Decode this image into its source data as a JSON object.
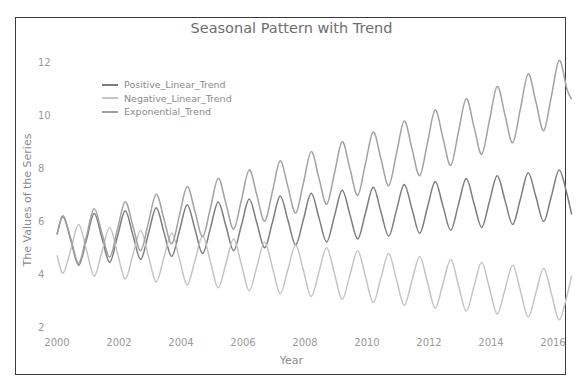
{
  "chart_data": {
    "type": "line",
    "title": "Seasonal Pattern with Trend",
    "xlabel": "Year",
    "ylabel": "The Values of the Series",
    "xlim": [
      2000,
      2016.7
    ],
    "ylim": [
      2,
      12.2
    ],
    "x_ticks": [
      "2000",
      "2002",
      "2004",
      "2006",
      "2008",
      "2010",
      "2012",
      "2014",
      "2016"
    ],
    "y_ticks": [
      "2",
      "4",
      "6",
      "8",
      "10",
      "12"
    ],
    "grid": false,
    "legend_position": "upper left",
    "x": [
      0,
      0.2,
      0.45,
      0.7,
      0.95,
      1.2,
      1.45,
      1.7,
      1.95,
      2.2,
      2.45,
      2.7,
      2.95,
      3.2,
      3.45,
      3.7,
      3.95,
      4.2,
      4.45,
      4.7,
      4.95,
      5.2,
      5.45,
      5.7,
      5.95,
      6.2,
      6.45,
      6.7,
      6.95,
      7.2,
      7.45,
      7.7,
      7.95,
      8.2,
      8.45,
      8.7,
      8.95,
      9.2,
      9.45,
      9.7,
      9.95,
      10.2,
      10.45,
      10.7,
      10.95,
      11.2,
      11.45,
      11.7,
      11.95,
      12.2,
      12.45,
      12.7,
      12.95,
      13.2,
      13.45,
      13.7,
      13.95,
      14.2,
      14.45,
      14.7,
      14.95,
      15.2,
      15.45,
      15.7,
      15.95,
      16.2,
      16.45,
      16.6
    ],
    "x_offset_year": 2000,
    "series": [
      {
        "name": "Positive_Linear_Trend",
        "color": "#7d7d7d",
        "values": [
          5.49,
          6.17,
          5.25,
          4.33,
          5.3,
          6.28,
          5.36,
          4.44,
          5.41,
          6.39,
          5.47,
          4.55,
          5.52,
          6.5,
          5.58,
          4.66,
          5.63,
          6.61,
          5.69,
          4.77,
          5.74,
          6.72,
          5.8,
          4.88,
          5.85,
          6.83,
          5.91,
          4.99,
          5.96,
          6.94,
          6.02,
          5.1,
          6.07,
          7.05,
          6.13,
          5.21,
          6.18,
          7.16,
          6.24,
          5.32,
          6.29,
          7.27,
          6.35,
          5.43,
          6.4,
          7.38,
          6.46,
          5.54,
          6.51,
          7.49,
          6.57,
          5.65,
          6.62,
          7.6,
          6.68,
          5.76,
          6.73,
          7.71,
          6.79,
          5.87,
          6.84,
          7.82,
          6.9,
          5.98,
          6.95,
          7.93,
          7.01,
          6.25
        ]
      },
      {
        "name": "Negative_Linear_Trend",
        "color": "#c4c4c4",
        "values": [
          4.71,
          4.03,
          4.95,
          5.87,
          4.9,
          3.92,
          4.84,
          5.76,
          4.79,
          3.81,
          4.73,
          5.65,
          4.68,
          3.7,
          4.62,
          5.54,
          4.57,
          3.59,
          4.51,
          5.43,
          4.46,
          3.48,
          4.4,
          5.32,
          4.35,
          3.37,
          4.29,
          5.21,
          4.24,
          3.26,
          4.18,
          5.1,
          4.13,
          3.15,
          4.07,
          4.99,
          4.02,
          3.04,
          3.96,
          4.88,
          3.91,
          2.93,
          3.85,
          4.77,
          3.8,
          2.82,
          3.74,
          4.66,
          3.69,
          2.71,
          3.63,
          4.55,
          3.58,
          2.6,
          3.52,
          4.44,
          3.47,
          2.49,
          3.41,
          4.33,
          3.36,
          2.38,
          3.3,
          4.22,
          3.25,
          2.27,
          3.19,
          3.94
        ]
      },
      {
        "name": "Exponential_Trend",
        "color": "#a2a2a2",
        "values": [
          5.49,
          6.2,
          5.31,
          4.41,
          5.43,
          6.46,
          5.55,
          4.64,
          5.68,
          6.73,
          5.81,
          4.88,
          5.94,
          7.01,
          6.08,
          5.14,
          6.21,
          7.3,
          6.36,
          5.41,
          6.5,
          7.61,
          6.65,
          5.7,
          6.8,
          7.93,
          6.96,
          5.99,
          7.12,
          8.27,
          7.28,
          6.3,
          7.45,
          8.62,
          7.62,
          6.63,
          7.8,
          8.99,
          7.98,
          6.97,
          8.16,
          9.36,
          8.35,
          7.33,
          8.54,
          9.77,
          8.74,
          7.71,
          8.94,
          10.19,
          9.14,
          8.1,
          9.35,
          10.62,
          9.57,
          8.52,
          9.79,
          11.08,
          10.02,
          8.95,
          10.25,
          11.55,
          10.48,
          9.41,
          10.73,
          12.06,
          10.97,
          10.6
        ]
      }
    ]
  }
}
